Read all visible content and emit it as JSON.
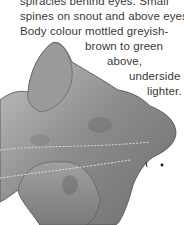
{
  "text_lines": [
    "spiracles behind eyes. Small",
    "spines on snout and above eyes.",
    "Body colour mottled greyish-",
    "brown to green",
    "above,",
    "underside",
    "lighter."
  ],
  "illustration": {
    "subject": "flattened shark (angel shark) viewed from above",
    "colors": {
      "body": "#8f8f8f",
      "dark": "#5a5a5a",
      "light": "#b8b8b8"
    }
  }
}
